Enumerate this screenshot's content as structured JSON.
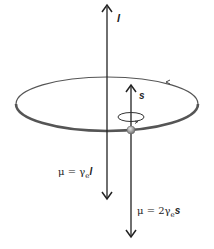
{
  "diagram": {
    "orbit": {
      "label": "orbit",
      "direction_arrow": "counterclockwise"
    },
    "vectors": {
      "orbital_angular_momentum": {
        "symbol": "l"
      },
      "spin_angular_momentum": {
        "symbol": "s"
      },
      "orbital_moment": {
        "prefix": "μ  =  γ",
        "subscript": "e",
        "symbol": "l"
      },
      "spin_moment": {
        "prefix": "μ  =  2γ",
        "subscript": "e",
        "symbol": "s"
      }
    },
    "colors": {
      "line": "#222222",
      "orbit": "#555555",
      "electron": "#9a9a9a"
    }
  }
}
